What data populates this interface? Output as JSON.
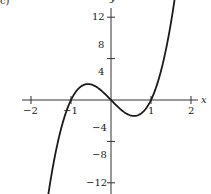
{
  "panel_label": "c)",
  "chart_data": {
    "type": "line",
    "title": "",
    "xlabel": "x",
    "ylabel": "y",
    "xlim": [
      -2.5,
      2.5
    ],
    "ylim": [
      -13,
      14
    ],
    "grid": false,
    "legend": null,
    "x_ticks": [
      -2,
      -1,
      0,
      1,
      2
    ],
    "x_tick_labels": [
      "−2",
      "−1",
      "",
      "1",
      "2"
    ],
    "y_ticks": [
      -12,
      -6,
      6,
      12
    ],
    "y_tick_labels": [
      "−12",
      "−8",
      "−4",
      "4",
      "8",
      "12"
    ],
    "y_tick_label_values": [
      -12,
      -8,
      -4,
      4,
      8,
      12
    ],
    "series": [
      {
        "name": "f(x)",
        "function": "6x^3 - 6x",
        "x": [
          -1.6,
          -1.5,
          -1.25,
          -1.0,
          -0.75,
          -0.577,
          -0.5,
          -0.25,
          0,
          0.25,
          0.5,
          0.577,
          0.75,
          1.0,
          1.25,
          1.5,
          1.62
        ],
        "y": [
          -14.98,
          -11.25,
          -4.22,
          0,
          1.97,
          2.31,
          2.25,
          1.41,
          0,
          -1.41,
          -2.25,
          -2.31,
          -1.97,
          0,
          4.22,
          11.25,
          15.79
        ]
      }
    ],
    "color": "#1a1a1a"
  }
}
